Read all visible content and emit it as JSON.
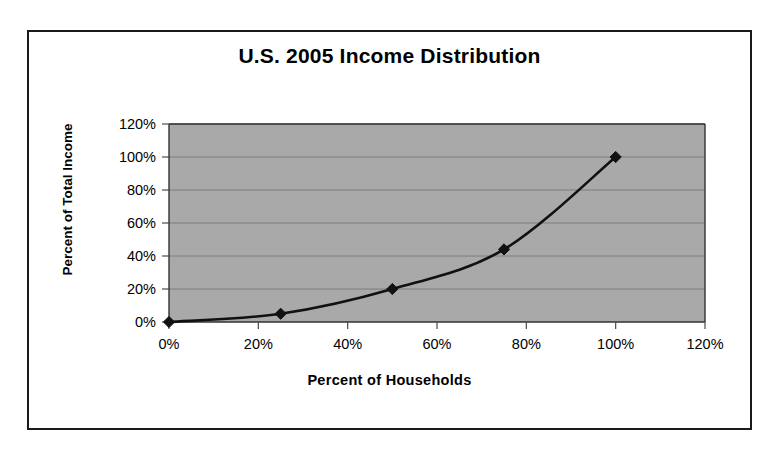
{
  "chart_data": {
    "type": "line",
    "title": "U.S. 2005 Income Distribution",
    "xlabel": "Percent of Households",
    "ylabel": "Percent of Total Income",
    "x": [
      0,
      25,
      50,
      75,
      100
    ],
    "values": [
      0,
      5,
      20,
      44,
      100
    ],
    "series": [
      {
        "name": "Cumulative income share",
        "x": [
          0,
          25,
          50,
          75,
          100
        ],
        "values": [
          0,
          5,
          20,
          44,
          100
        ]
      }
    ],
    "xlim": [
      0,
      120
    ],
    "ylim": [
      0,
      120
    ],
    "xticks": [
      0,
      20,
      40,
      60,
      80,
      100,
      120
    ],
    "yticks": [
      0,
      20,
      40,
      60,
      80,
      100,
      120
    ],
    "xtick_labels": [
      "0%",
      "20%",
      "40%",
      "60%",
      "80%",
      "100%",
      "120%"
    ],
    "ytick_labels": [
      "0%",
      "20%",
      "40%",
      "60%",
      "80%",
      "100%",
      "120%"
    ],
    "grid": true,
    "legend": false,
    "legend_position": "none",
    "marker": "diamond",
    "plot_background_color": "#a9a9a9",
    "line_color": "#111111",
    "marker_color": "#111111",
    "gridline_color": "#7d7d7d",
    "frame_border_color": "#1a1a1a",
    "chart_background_color": "#ffffff"
  }
}
